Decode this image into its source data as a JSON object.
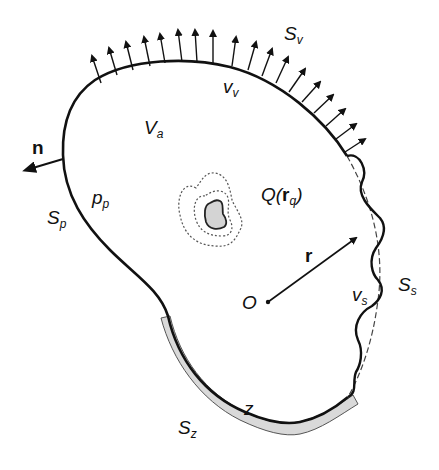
{
  "diagram": {
    "type": "acoustic domain boundary diagram",
    "labels": {
      "S_v": {
        "main": "S",
        "sub": "v"
      },
      "v_v": {
        "main": "v",
        "sub": "v"
      },
      "V_a": {
        "main": "V",
        "sub": "a"
      },
      "n": {
        "main": "n"
      },
      "p_p": {
        "main": "p",
        "sub": "p"
      },
      "S_p": {
        "main": "S",
        "sub": "p"
      },
      "Q": {
        "main": "Q(",
        "bold": "r",
        "sub": "q",
        "close": ")"
      },
      "r": {
        "main": "r"
      },
      "O": {
        "main": "O"
      },
      "v_s": {
        "main": "v",
        "sub": "s"
      },
      "S_s": {
        "main": "S",
        "sub": "s"
      },
      "z": {
        "main": "z"
      },
      "S_z": {
        "main": "S",
        "sub": "z"
      }
    },
    "colors": {
      "stroke": "#111111",
      "impedance_fill": "#d9d9d9",
      "source_fill": "#d4d4d4",
      "background": "#ffffff"
    }
  }
}
